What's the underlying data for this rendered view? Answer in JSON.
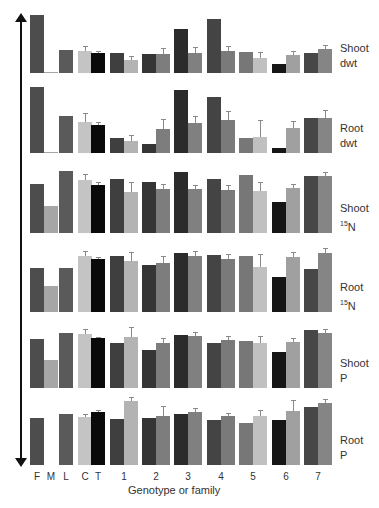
{
  "chart_data": {
    "type": "bar",
    "title": "",
    "xlabel": "Genotype or family",
    "ylabel": "Relative trait variation",
    "categories": [
      "F",
      "M",
      "L",
      "C",
      "T",
      "1",
      "2",
      "3",
      "4",
      "5",
      "6",
      "7"
    ],
    "bar_slots": [
      "F",
      "M",
      "L",
      "C",
      "T",
      "1a",
      "1b",
      "2a",
      "2b",
      "3a",
      "3b",
      "4a",
      "4b",
      "5a",
      "5b",
      "6a",
      "6b",
      "7a",
      "7b"
    ],
    "colors": {
      "F": "#4d4d4d",
      "M": "#a6a6a6",
      "L": "#5a5a5a",
      "C": "#c4c4c4",
      "T": "#0a0a0a",
      "1a": "#3f3f3f",
      "1b": "#b3b3b3",
      "2a": "#353535",
      "2b": "#7d7d7d",
      "3a": "#2b2b2b",
      "3b": "#808080",
      "4a": "#444444",
      "4b": "#7a7a7a",
      "5a": "#777777",
      "5b": "#c0c0c0",
      "6a": "#161616",
      "6b": "#a0a0a0",
      "7a": "#474747",
      "7b": "#858585"
    },
    "panels": [
      {
        "name": "Shoot dwt",
        "label_line1": "Shoot",
        "label_line2": "dwt",
        "label_sup": "",
        "values": [
          58,
          1,
          23,
          22,
          20,
          20,
          13,
          19,
          19,
          44,
          20,
          54,
          22,
          21,
          15,
          9,
          18,
          20,
          24
        ],
        "errors": [
          0,
          0,
          0,
          5,
          2,
          0,
          4,
          0,
          6,
          0,
          6,
          0,
          5,
          0,
          6,
          0,
          4,
          0,
          4
        ]
      },
      {
        "name": "Root dwt",
        "label_line1": "Root",
        "label_line2": "dwt",
        "label_sup": "",
        "values": [
          66,
          1,
          37,
          31,
          28,
          15,
          12,
          9,
          24,
          63,
          30,
          56,
          33,
          15,
          16,
          5,
          25,
          35,
          35
        ],
        "errors": [
          0,
          0,
          0,
          9,
          3,
          0,
          6,
          0,
          10,
          0,
          7,
          0,
          9,
          0,
          17,
          0,
          7,
          0,
          8
        ]
      },
      {
        "name": "Shoot 15N",
        "label_line1": "Shoot",
        "label_line2": "N",
        "label_sup": "15",
        "values": [
          49,
          27,
          62,
          53,
          48,
          54,
          41,
          51,
          44,
          61,
          44,
          54,
          43,
          58,
          42,
          31,
          45,
          57,
          57
        ],
        "errors": [
          0,
          0,
          0,
          6,
          3,
          0,
          10,
          0,
          5,
          0,
          4,
          0,
          5,
          0,
          9,
          0,
          4,
          0,
          4
        ]
      },
      {
        "name": "Root 15N",
        "label_line1": "Root",
        "label_line2": "N",
        "label_sup": "15",
        "values": [
          44,
          26,
          44,
          56,
          53,
          56,
          51,
          47,
          49,
          59,
          56,
          57,
          53,
          56,
          45,
          35,
          55,
          43,
          59
        ],
        "errors": [
          0,
          0,
          0,
          5,
          2,
          0,
          9,
          0,
          7,
          0,
          5,
          0,
          5,
          0,
          13,
          0,
          5,
          0,
          5
        ]
      },
      {
        "name": "Shoot P",
        "label_line1": "Shoot",
        "label_line2": "P",
        "label_sup": "",
        "values": [
          49,
          28,
          55,
          54,
          50,
          45,
          51,
          38,
          45,
          53,
          52,
          45,
          48,
          47,
          45,
          36,
          46,
          58,
          55
        ],
        "errors": [
          0,
          0,
          0,
          5,
          1,
          0,
          10,
          0,
          5,
          0,
          4,
          0,
          4,
          0,
          7,
          0,
          4,
          0,
          4
        ]
      },
      {
        "name": "Root P",
        "label_line1": "Root",
        "label_line2": "P",
        "label_sup": "",
        "values": [
          47,
          0,
          51,
          48,
          53,
          46,
          64,
          47,
          49,
          51,
          53,
          45,
          49,
          42,
          49,
          45,
          54,
          58,
          62
        ],
        "errors": [
          0,
          0,
          0,
          3,
          2,
          0,
          4,
          0,
          10,
          0,
          4,
          0,
          3,
          0,
          6,
          0,
          11,
          0,
          4
        ]
      }
    ],
    "legend": "none",
    "grid": false
  }
}
